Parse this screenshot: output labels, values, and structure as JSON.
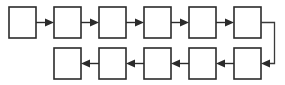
{
  "diagram": {
    "stroke_color": "#2b2b2b",
    "box_fill_color": "#ffffff",
    "background_color": "#ffffff",
    "canvas": {
      "width": 285,
      "height": 85
    },
    "box_size": {
      "width": 27,
      "height": 31
    },
    "column_pitch": 45,
    "rows": [
      {
        "id": "top-row",
        "direction": "left-to-right",
        "y": 7,
        "boxes": [
          {
            "id": "box-1",
            "label": "",
            "x": 9
          },
          {
            "id": "box-2",
            "label": "",
            "x": 54
          },
          {
            "id": "box-3",
            "label": "",
            "x": 99
          },
          {
            "id": "box-4",
            "label": "",
            "x": 144
          },
          {
            "id": "box-5",
            "label": "",
            "x": 189
          },
          {
            "id": "box-6",
            "label": "",
            "x": 234
          }
        ],
        "arrows": [
          {
            "id": "arrow-1-2",
            "from": "box-1",
            "to": "box-2",
            "points": "right"
          },
          {
            "id": "arrow-2-3",
            "from": "box-2",
            "to": "box-3",
            "points": "right"
          },
          {
            "id": "arrow-3-4",
            "from": "box-3",
            "to": "box-4",
            "points": "right"
          },
          {
            "id": "arrow-4-5",
            "from": "box-4",
            "to": "box-5",
            "points": "right"
          },
          {
            "id": "arrow-5-6",
            "from": "box-5",
            "to": "box-6",
            "points": "right"
          }
        ]
      },
      {
        "id": "bottom-row",
        "direction": "right-to-left",
        "y": 48,
        "boxes": [
          {
            "id": "box-11",
            "label": "",
            "x": 54
          },
          {
            "id": "box-10",
            "label": "",
            "x": 99
          },
          {
            "id": "box-9",
            "label": "",
            "x": 144
          },
          {
            "id": "box-8",
            "label": "",
            "x": 189
          },
          {
            "id": "box-7",
            "label": "",
            "x": 234
          }
        ],
        "arrows": [
          {
            "id": "arrow-7-8",
            "from": "box-7",
            "to": "box-8",
            "points": "left"
          },
          {
            "id": "arrow-8-9",
            "from": "box-8",
            "to": "box-9",
            "points": "left"
          },
          {
            "id": "arrow-9-10",
            "from": "box-9",
            "to": "box-10",
            "points": "left"
          },
          {
            "id": "arrow-10-11",
            "from": "box-10",
            "to": "box-11",
            "points": "left"
          }
        ]
      }
    ],
    "loop_connector": {
      "id": "wrap-connector",
      "from": "box-6",
      "to": "box-7",
      "points": "left",
      "path": "M 261 22.5 L 274 22.5 L 274 63.5 L 263 63.5"
    }
  }
}
